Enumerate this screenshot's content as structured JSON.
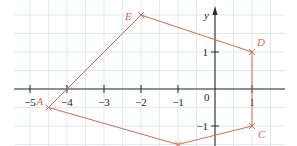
{
  "diagram": {
    "type": "coordinate-plane-polygon",
    "axes": {
      "x_label": "",
      "y_label": "y",
      "x_ticks": [
        {
          "value": -5,
          "label": "−5"
        },
        {
          "value": -4,
          "label": "−4"
        },
        {
          "value": -3,
          "label": "−3"
        },
        {
          "value": -2,
          "label": "−2"
        },
        {
          "value": -1,
          "label": "−1"
        },
        {
          "value": 1,
          "label": "1"
        }
      ],
      "y_ticks": [
        {
          "value": 1,
          "label": "1"
        },
        {
          "value": -1,
          "label": "−1"
        }
      ],
      "origin_label": "0"
    },
    "vertices": [
      {
        "name": "A",
        "x": -4.5,
        "y": -0.5,
        "label": "A"
      },
      {
        "name": "E",
        "x": -2,
        "y": 2,
        "label": "E"
      },
      {
        "name": "D",
        "x": 1,
        "y": 1,
        "label": "D"
      },
      {
        "name": "C",
        "x": 1,
        "y": -1,
        "label": "C"
      },
      {
        "name": "B",
        "x": -1,
        "y": -1.5,
        "label": ""
      }
    ],
    "polygon_order": [
      "A",
      "E",
      "D",
      "C",
      "B"
    ],
    "colors": {
      "polygon": "#d9694f",
      "grid": "#dbe3ea",
      "axis": "#2b2b2b"
    }
  }
}
